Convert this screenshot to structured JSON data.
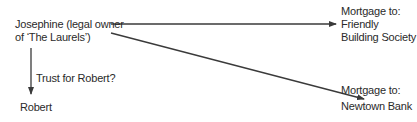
{
  "diagram": {
    "nodes": {
      "josephine": {
        "line1": "Josephine (legal owner",
        "line2": "of ‘The Laurels’)"
      },
      "friendly": {
        "line1": "Mortgage to:",
        "line2": "Friendly",
        "line3": "Building Society"
      },
      "newtown": {
        "line1": "Mortgage to:",
        "line2": "Newtown Bank"
      },
      "robert": {
        "line1": "Robert"
      }
    },
    "edges": [
      {
        "from": "josephine",
        "to": "friendly",
        "label": ""
      },
      {
        "from": "josephine",
        "to": "newtown",
        "label": ""
      },
      {
        "from": "josephine",
        "to": "robert",
        "label": "Trust for Robert?"
      }
    ],
    "colors": {
      "line": "#3a3a3a",
      "text": "#2a2a2a",
      "background": "#ffffff"
    }
  }
}
